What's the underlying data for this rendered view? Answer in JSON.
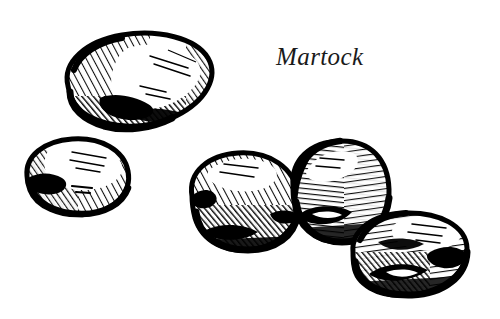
{
  "plate": {
    "title": "Martock",
    "caption": "Martock",
    "width": 500,
    "height": 319,
    "background_color": "#ffffff",
    "ink_color": "#000000",
    "caption_color": "#1a1a1a",
    "medium": "pen-and-ink hatched line drawing",
    "subject": "five potato tubers"
  },
  "figures": [
    {
      "name": "potato-top-left",
      "label": "tuber 1",
      "position": {
        "x": 62,
        "y": 33,
        "width": 150,
        "height": 93
      },
      "center": {
        "x": 137,
        "y": 79
      },
      "rotation_deg": -17,
      "radius": {
        "rx": 74,
        "ry": 44
      },
      "shading": "dense diagonal hatching along upper-left rim and heavy cross-hatched shadow along lower edge, pale highlight at centre-right",
      "highlight": "centre-right",
      "eye_marks": 1
    },
    {
      "name": "potato-left-middle",
      "label": "tuber 2",
      "position": {
        "x": 25,
        "y": 138,
        "width": 104,
        "height": 78
      },
      "center": {
        "x": 77,
        "y": 177
      },
      "rotation_deg": -8,
      "radius": {
        "rx": 52,
        "ry": 39
      },
      "shading": "fine parallel hatching sweeping lower-left to upper-right, solid black notch at left flank",
      "highlight": "upper-right",
      "eye_marks": 1
    },
    {
      "name": "potato-centre-left",
      "label": "tuber 3",
      "position": {
        "x": 189,
        "y": 152,
        "width": 110,
        "height": 99
      },
      "center": {
        "x": 244,
        "y": 201
      },
      "rotation_deg": -12,
      "radius": {
        "rx": 55,
        "ry": 50
      },
      "shading": "close-ruled diagonal hatching rising to the right, dark clotted base and left rim",
      "highlight": "upper-centre",
      "eye_marks": 1
    },
    {
      "name": "potato-centre-right",
      "label": "tuber 4",
      "position": {
        "x": 290,
        "y": 140,
        "width": 100,
        "height": 103
      },
      "center": {
        "x": 340,
        "y": 191
      },
      "rotation_deg": 6,
      "radius": {
        "rx": 50,
        "ry": 52
      },
      "shading": "curved horizontal hatching wrapping the body, heavy black lens-shaped eye at lower-left",
      "highlight": "upper-left",
      "eye_marks": 2
    },
    {
      "name": "potato-bottom-right",
      "label": "tuber 5",
      "position": {
        "x": 350,
        "y": 212,
        "width": 118,
        "height": 84
      },
      "center": {
        "x": 409,
        "y": 254
      },
      "rotation_deg": -9,
      "radius": {
        "rx": 59,
        "ry": 42
      },
      "shading": "long horizontal hatching with dark blotches at right flank and lower-left, thick outline",
      "highlight": "upper-right",
      "eye_marks": 2
    }
  ]
}
